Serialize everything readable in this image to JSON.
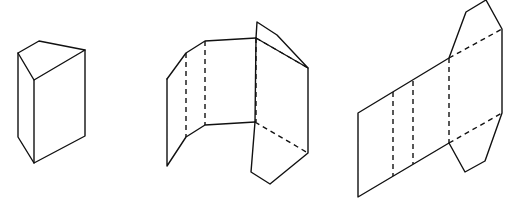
{
  "diagram": {
    "line_color": "#111111",
    "background": "#ffffff",
    "figures": [
      {
        "name": "closed-triangular-prism",
        "solid_paths": [
          "M18,53 L39,41 L85,50 L34,80 Z",
          "M18,53 L18,137 L34,163 L85,136 L85,50",
          "M34,80 L34,163"
        ],
        "dashed_paths": []
      },
      {
        "name": "partially-unfolded-prism",
        "solid_paths": [
          "M167,79 L186,53 L205,41 L256,38 L308,68",
          "M256,38 L257,22 L277,35 L308,68 L308,153 L270,184 L251,172 L255,122",
          "M167,79 L167,166 L186,137 L205,125 L255,122",
          "M256,38 L255,122"
        ],
        "dashed_paths": [
          "M186,53 L186,137",
          "M205,41 L205,125",
          "M256,38 L256,122",
          "M256,38 L308,68",
          "M255,122 L308,153"
        ]
      },
      {
        "name": "flat-prism-net",
        "solid_paths": [
          "M358,113 L449,58 L466,12 L486,0 L502,29 L502,113 L485,161 L465,172 L449,143 L358,197 Z"
        ],
        "dashed_paths": [
          "M393,92 L393,176",
          "M413,81 L413,164",
          "M449,58 L449,143",
          "M449,58 L502,29",
          "M449,143 L502,113"
        ]
      }
    ]
  }
}
